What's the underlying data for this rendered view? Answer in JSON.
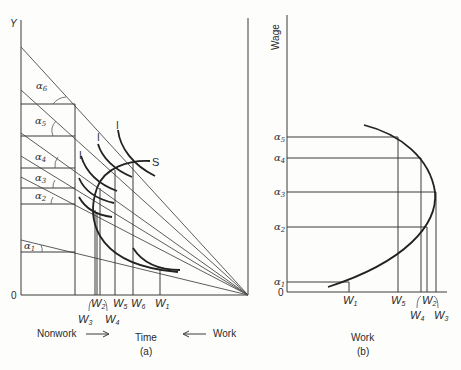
{
  "panel_a": {
    "y_axis_label": "Y",
    "origin_label": "0",
    "x_axis_caption": "Time",
    "panel_caption": "(a)",
    "nonwork_label": "Nonwork",
    "work_label": "Work",
    "supply_curve_label": "S",
    "indifference_label": "I",
    "budget_lines": [
      {
        "name": "α6",
        "sub": "6",
        "y_start": 47
      },
      {
        "name": "α5",
        "sub": "5",
        "y_start": 90
      },
      {
        "name": "α4",
        "sub": "4",
        "y_start": 133
      },
      {
        "name": "α3",
        "sub": "3",
        "y_start": 156
      },
      {
        "name": "α2",
        "sub": "2",
        "y_start": 177
      },
      {
        "name": "α1",
        "sub": "1",
        "y_start": 240
      }
    ],
    "work_points": [
      {
        "label": "W",
        "sub": "3",
        "x": 95
      },
      {
        "label": "W",
        "sub": "2",
        "x": 97
      },
      {
        "label": "W",
        "sub": "4",
        "x": 100
      },
      {
        "label": "W",
        "sub": "5",
        "x": 115
      },
      {
        "label": "W",
        "sub": "6",
        "x": 133
      },
      {
        "label": "W",
        "sub": "1",
        "x": 160
      }
    ]
  },
  "panel_b": {
    "y_axis_label": "Wage",
    "origin_label": "0",
    "x_axis_caption": "Work",
    "panel_caption": "(b)",
    "wage_levels": [
      {
        "label": "α",
        "sub": "5",
        "y": 137
      },
      {
        "label": "α",
        "sub": "4",
        "y": 158
      },
      {
        "label": "α",
        "sub": "3",
        "y": 192
      },
      {
        "label": "α",
        "sub": "2",
        "y": 227
      },
      {
        "label": "α",
        "sub": "1",
        "y": 282
      }
    ],
    "work_points": [
      {
        "label": "W",
        "sub": "1",
        "x": 349
      },
      {
        "label": "W",
        "sub": "5",
        "x": 398
      },
      {
        "label": "W",
        "sub": "4",
        "x": 421
      },
      {
        "label": "W",
        "sub": "2",
        "x": 427
      },
      {
        "label": "W",
        "sub": "3",
        "x": 436
      }
    ]
  }
}
